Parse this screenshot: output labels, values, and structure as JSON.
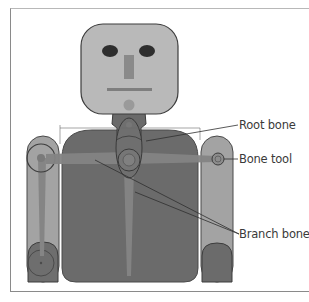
{
  "figure": {
    "type": "rigged character bone diagram",
    "callouts": [
      {
        "id": "root",
        "label": "Root bone"
      },
      {
        "id": "tool",
        "label": "Bone tool"
      },
      {
        "id": "branch",
        "label": "Branch bones"
      }
    ]
  },
  "colors": {
    "head_fill": "#b9b9b9",
    "body_fill": "#6b6b6b",
    "arm_fill": "#a3a3a3",
    "bone_fill": "#858585",
    "outline": "#3c3c3c",
    "label_text": "#3a3a3a"
  }
}
